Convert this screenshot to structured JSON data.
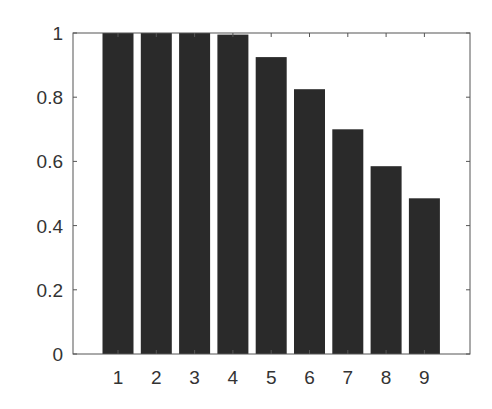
{
  "chart_data": {
    "type": "bar",
    "title": "",
    "xlabel": "",
    "ylabel": "",
    "categories": [
      "1",
      "2",
      "3",
      "4",
      "5",
      "6",
      "7",
      "8",
      "9"
    ],
    "values": [
      1.0,
      1.0,
      1.0,
      0.995,
      0.925,
      0.825,
      0.7,
      0.585,
      0.485
    ],
    "ylim": [
      0,
      1
    ],
    "xlim": [
      0.5,
      10
    ],
    "yticks": [
      0,
      0.2,
      0.4,
      0.6,
      0.8,
      1
    ],
    "ytick_labels": [
      "0",
      "0.2",
      "0.4",
      "0.6",
      "0.8",
      "1"
    ],
    "grid": false,
    "legend": null,
    "bar_color": "#2a2a2a"
  }
}
